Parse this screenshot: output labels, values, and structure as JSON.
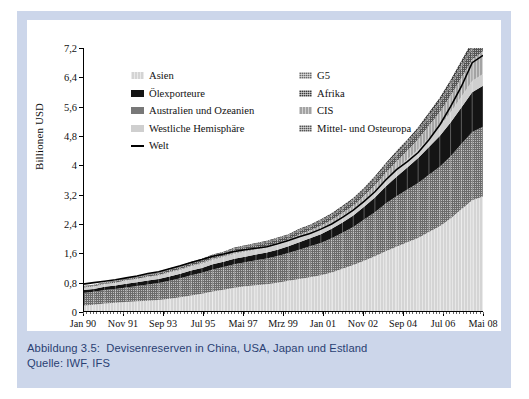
{
  "caption": {
    "line1": "Abbildung 3.5:  Devisenreserven in China, USA, Japan und Estland",
    "line2": "Quelle: IWF, IFS",
    "color": "#2a3f73"
  },
  "chart_data": {
    "type": "area",
    "title": "",
    "xlabel": "",
    "ylabel": "Billionen USD",
    "ylim": [
      0,
      7.2
    ],
    "yticks": [
      0,
      0.8,
      1.6,
      2.4,
      3.2,
      4,
      4.8,
      5.6,
      6.4,
      7.2
    ],
    "ytick_labels": [
      "0",
      "0,8",
      "1,6",
      "2,4",
      "3,2",
      "4",
      "4,8",
      "5,6",
      "6,4",
      "7,2"
    ],
    "grid": false,
    "legend_position": "upper-left-inside",
    "x_tick_labels": [
      "Jan 90",
      "Nov 91",
      "Sep 93",
      "Jul 95",
      "Mai 97",
      "Mrz 99",
      "Jan 01",
      "Nov 02",
      "Sep 04",
      "Jul 06",
      "Mai 08"
    ],
    "x": [
      "Jan 90",
      "Jul 90",
      "Jan 91",
      "Jul 91",
      "Jan 92",
      "Jul 92",
      "Jan 93",
      "Jul 93",
      "Jan 94",
      "Jul 94",
      "Jan 95",
      "Jul 95",
      "Jan 96",
      "Jul 96",
      "Jan 97",
      "Jul 97",
      "Jan 98",
      "Jul 98",
      "Jan 99",
      "Jul 99",
      "Jan 00",
      "Jul 00",
      "Jan 01",
      "Jul 01",
      "Jan 02",
      "Jul 02",
      "Jan 03",
      "Jul 03",
      "Jan 04",
      "Jul 04",
      "Jan 05",
      "Jul 05",
      "Jan 06",
      "Jul 06",
      "Jan 07",
      "Jul 07",
      "Jan 08",
      "Mai 08"
    ],
    "series": [
      {
        "name": "Asien",
        "color": "#d4d4d4",
        "texture": "vstripe",
        "values": [
          0.18,
          0.2,
          0.23,
          0.25,
          0.27,
          0.29,
          0.31,
          0.33,
          0.36,
          0.4,
          0.45,
          0.5,
          0.56,
          0.61,
          0.66,
          0.7,
          0.73,
          0.76,
          0.8,
          0.85,
          0.9,
          0.95,
          1.0,
          1.08,
          1.18,
          1.28,
          1.4,
          1.52,
          1.66,
          1.78,
          1.9,
          2.02,
          2.18,
          2.34,
          2.55,
          2.8,
          3.05,
          3.15
        ]
      },
      {
        "name": "G5",
        "color": "#6b6b6b",
        "texture": "dots",
        "values": [
          0.34,
          0.35,
          0.37,
          0.38,
          0.4,
          0.42,
          0.44,
          0.46,
          0.49,
          0.52,
          0.55,
          0.57,
          0.6,
          0.62,
          0.64,
          0.66,
          0.68,
          0.7,
          0.73,
          0.76,
          0.8,
          0.84,
          0.88,
          0.93,
          0.98,
          1.04,
          1.12,
          1.2,
          1.3,
          1.38,
          1.44,
          1.5,
          1.56,
          1.62,
          1.7,
          1.78,
          1.86,
          1.9
        ]
      },
      {
        "name": "Ölexporteure",
        "color": "#141414",
        "texture": "none",
        "values": [
          0.08,
          0.08,
          0.09,
          0.09,
          0.1,
          0.1,
          0.11,
          0.11,
          0.12,
          0.12,
          0.13,
          0.13,
          0.14,
          0.14,
          0.15,
          0.15,
          0.16,
          0.16,
          0.17,
          0.18,
          0.2,
          0.22,
          0.24,
          0.26,
          0.28,
          0.31,
          0.35,
          0.4,
          0.46,
          0.53,
          0.6,
          0.68,
          0.76,
          0.84,
          0.92,
          1.0,
          1.08,
          1.12
        ]
      },
      {
        "name": "Westliche Hemisphäre",
        "color": "#cfcfcf",
        "texture": "none",
        "values": [
          0.06,
          0.06,
          0.07,
          0.07,
          0.08,
          0.08,
          0.09,
          0.09,
          0.1,
          0.1,
          0.11,
          0.11,
          0.12,
          0.12,
          0.13,
          0.13,
          0.13,
          0.13,
          0.14,
          0.14,
          0.15,
          0.15,
          0.16,
          0.16,
          0.17,
          0.17,
          0.18,
          0.19,
          0.2,
          0.21,
          0.22,
          0.23,
          0.24,
          0.25,
          0.27,
          0.29,
          0.31,
          0.32
        ]
      },
      {
        "name": "CIS",
        "color": "#a3a3a3",
        "texture": "vstripe",
        "values": [
          0.01,
          0.01,
          0.01,
          0.01,
          0.02,
          0.02,
          0.02,
          0.02,
          0.03,
          0.03,
          0.03,
          0.04,
          0.04,
          0.04,
          0.05,
          0.05,
          0.05,
          0.05,
          0.05,
          0.05,
          0.06,
          0.06,
          0.07,
          0.08,
          0.09,
          0.1,
          0.12,
          0.14,
          0.17,
          0.2,
          0.24,
          0.28,
          0.34,
          0.4,
          0.46,
          0.52,
          0.58,
          0.62
        ]
      },
      {
        "name": "Mittel- und Osteuropa",
        "color": "#555555",
        "texture": "dots",
        "values": [
          0.02,
          0.02,
          0.02,
          0.03,
          0.03,
          0.03,
          0.04,
          0.04,
          0.05,
          0.05,
          0.06,
          0.06,
          0.07,
          0.07,
          0.08,
          0.08,
          0.08,
          0.09,
          0.09,
          0.09,
          0.1,
          0.1,
          0.11,
          0.11,
          0.12,
          0.13,
          0.14,
          0.15,
          0.17,
          0.18,
          0.19,
          0.2,
          0.22,
          0.24,
          0.26,
          0.28,
          0.3,
          0.31
        ]
      },
      {
        "name": "Australien und Ozeanien",
        "color": "#787878",
        "texture": "none",
        "values": [
          0.01,
          0.01,
          0.01,
          0.01,
          0.01,
          0.01,
          0.02,
          0.02,
          0.02,
          0.02,
          0.02,
          0.02,
          0.02,
          0.02,
          0.03,
          0.03,
          0.03,
          0.03,
          0.03,
          0.03,
          0.03,
          0.03,
          0.04,
          0.04,
          0.04,
          0.04,
          0.04,
          0.05,
          0.05,
          0.05,
          0.05,
          0.06,
          0.06,
          0.06,
          0.07,
          0.07,
          0.08,
          0.08
        ]
      },
      {
        "name": "Afrika",
        "color": "#3a3a3a",
        "texture": "dots",
        "values": [
          0.01,
          0.01,
          0.01,
          0.01,
          0.01,
          0.01,
          0.01,
          0.01,
          0.02,
          0.02,
          0.02,
          0.02,
          0.02,
          0.02,
          0.02,
          0.02,
          0.02,
          0.02,
          0.02,
          0.02,
          0.03,
          0.03,
          0.03,
          0.03,
          0.04,
          0.04,
          0.04,
          0.05,
          0.05,
          0.06,
          0.06,
          0.07,
          0.08,
          0.09,
          0.1,
          0.11,
          0.12,
          0.13
        ]
      }
    ],
    "line_series": {
      "name": "Welt",
      "color": "#000000",
      "values": [
        0.76,
        0.8,
        0.84,
        0.88,
        0.93,
        0.98,
        1.05,
        1.1,
        1.18,
        1.26,
        1.35,
        1.43,
        1.52,
        1.58,
        1.65,
        1.7,
        1.74,
        1.78,
        1.86,
        1.95,
        2.05,
        2.14,
        2.26,
        2.4,
        2.58,
        2.78,
        3.02,
        3.28,
        3.6,
        3.88,
        4.1,
        4.35,
        4.7,
        5.1,
        5.6,
        6.15,
        6.8,
        7.0
      ]
    }
  },
  "legend": {
    "rows": [
      {
        "left": {
          "label": "Asien",
          "swatch": "asien"
        },
        "right": {
          "label": "G5",
          "swatch": "g5"
        }
      },
      {
        "left": {
          "label": "Ölexporteure",
          "swatch": "oelexporteure"
        },
        "right": {
          "label": "Afrika",
          "swatch": "afrika"
        }
      },
      {
        "left": {
          "label": "Australien und Ozeanien",
          "swatch": "australien"
        },
        "right": {
          "label": "CIS",
          "swatch": "cis"
        }
      },
      {
        "left": {
          "label": "Westliche Hemisphäre",
          "swatch": "westliche"
        },
        "right": {
          "label": "Mittel- und Osteuropa",
          "swatch": "mittelost"
        }
      },
      {
        "left": {
          "label": "Welt",
          "swatch": "line"
        },
        "right": {
          "label": "",
          "swatch": ""
        }
      }
    ]
  }
}
